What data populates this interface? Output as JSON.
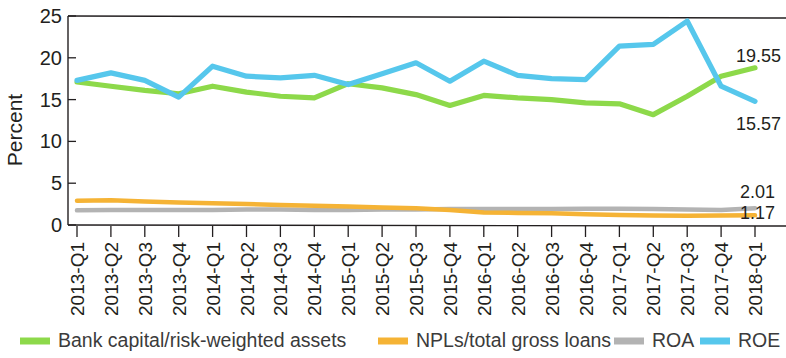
{
  "chart_data": {
    "type": "line",
    "title": "",
    "xlabel": "",
    "ylabel": "Percent",
    "ylim": [
      0,
      25
    ],
    "yticks": [
      0,
      5,
      10,
      15,
      20,
      25
    ],
    "grid": false,
    "legend_position": "bottom",
    "categories": [
      "2013-Q1",
      "2013-Q2",
      "2013-Q3",
      "2013-Q4",
      "2014-Q1",
      "2014-Q2",
      "2014-Q3",
      "2014-Q4",
      "2015-Q1",
      "2015-Q2",
      "2015-Q3",
      "2015-Q4",
      "2016-Q1",
      "2016-Q2",
      "2016-Q3",
      "2016-Q4",
      "2017-Q1",
      "2017-Q2",
      "2017-Q3",
      "2017-Q4",
      "2018-Q1"
    ],
    "series": [
      {
        "name": "Bank capital/risk-weighted assets",
        "color": "#8dd94a",
        "end_label": "19.55",
        "values": [
          17.1,
          16.6,
          16.1,
          15.7,
          16.6,
          15.9,
          15.4,
          15.2,
          16.9,
          16.4,
          15.6,
          14.3,
          15.5,
          15.2,
          15.0,
          14.6,
          14.5,
          13.2,
          15.4,
          17.8,
          18.8
        ]
      },
      {
        "name": "NPLs/total gross loans",
        "color": "#f5b335",
        "end_label": "1.17",
        "values": [
          2.9,
          2.95,
          2.8,
          2.7,
          2.6,
          2.5,
          2.4,
          2.3,
          2.2,
          2.1,
          2.0,
          1.8,
          1.5,
          1.45,
          1.4,
          1.3,
          1.2,
          1.15,
          1.1,
          1.15,
          1.17
        ]
      },
      {
        "name": "ROA",
        "color": "#b3b3b3",
        "end_label": "2.01",
        "values": [
          1.75,
          1.8,
          1.78,
          1.8,
          1.8,
          1.85,
          1.85,
          1.8,
          1.8,
          1.85,
          1.85,
          1.9,
          1.9,
          1.9,
          1.9,
          1.95,
          1.95,
          1.9,
          1.85,
          1.8,
          2.01
        ]
      },
      {
        "name": "ROE",
        "color": "#56c7ec",
        "end_label": "15.57",
        "values": [
          17.3,
          18.2,
          17.3,
          15.3,
          19.0,
          17.8,
          17.6,
          17.9,
          16.8,
          18.1,
          19.4,
          17.2,
          19.6,
          17.9,
          17.5,
          17.4,
          21.4,
          21.6,
          24.4,
          16.6,
          14.8
        ]
      }
    ],
    "end_labels": [
      {
        "text": "19.55",
        "value": 19.55,
        "series": "Bank capital/risk-weighted assets"
      },
      {
        "text": "15.57",
        "value": 15.57,
        "series": "ROE"
      },
      {
        "text": "2.01",
        "value": 2.01,
        "series": "ROA"
      },
      {
        "text": "1.17",
        "value": 1.17,
        "series": "NPLs/total gross loans"
      }
    ]
  },
  "legend": {
    "items": [
      {
        "label": "Bank capital/risk-weighted assets",
        "color": "#8dd94a",
        "swatch_name": "legend-swatch-bank-capital"
      },
      {
        "label": "NPLs/total gross loans",
        "color": "#f5b335",
        "swatch_name": "legend-swatch-npls"
      },
      {
        "label": "ROA",
        "color": "#b3b3b3",
        "swatch_name": "legend-swatch-roa"
      },
      {
        "label": "ROE",
        "color": "#56c7ec",
        "swatch_name": "legend-swatch-roe"
      }
    ]
  },
  "axis": {
    "y_title": "Percent",
    "y_tick_labels": [
      "25",
      "20",
      "15",
      "10",
      "5",
      "0"
    ]
  }
}
